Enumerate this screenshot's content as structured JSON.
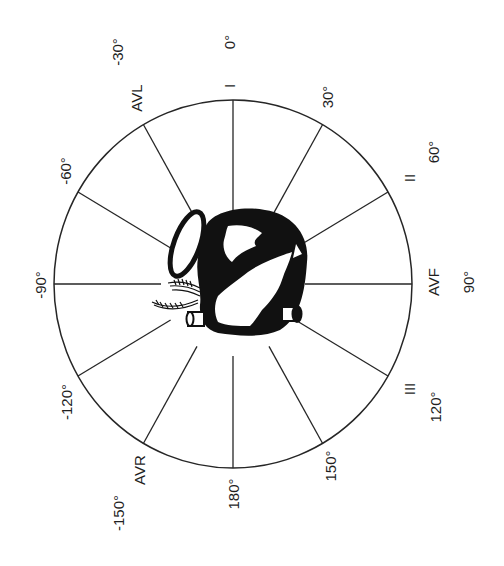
{
  "diagram": {
    "center": {
      "x": 233,
      "y": 284
    },
    "radius": {
      "rx": 179,
      "ry": 184
    },
    "spoke_inner_radius": 72,
    "colors": {
      "line": "#262626",
      "text": "#1f1f1f",
      "heart": "#111111",
      "background": "#ffffff"
    },
    "orientation": "rotated 90° counter-clockwise; 0° at top, angles increase clockwise",
    "spokes_deg": [
      0,
      30,
      60,
      90,
      120,
      150,
      180,
      -150,
      -120,
      -90,
      -60,
      -30
    ],
    "degree_labels": [
      {
        "text": "0°",
        "x": 229,
        "y": 42
      },
      {
        "text": "30°",
        "x": 327,
        "y": 97
      },
      {
        "text": "60°",
        "x": 433,
        "y": 152
      },
      {
        "text": "90°",
        "x": 468,
        "y": 282
      },
      {
        "text": "120°",
        "x": 435,
        "y": 407
      },
      {
        "text": "150°",
        "x": 330,
        "y": 466
      },
      {
        "text": "180°",
        "x": 233,
        "y": 494
      },
      {
        "text": "-150°",
        "x": 118,
        "y": 513
      },
      {
        "text": "-120°",
        "x": 66,
        "y": 402
      },
      {
        "text": "-90°",
        "x": 40,
        "y": 285
      },
      {
        "text": "-60°",
        "x": 65,
        "y": 171
      },
      {
        "text": "-30°",
        "x": 117,
        "y": 52
      }
    ],
    "lead_labels": [
      {
        "text": "I",
        "x": 229,
        "y": 86
      },
      {
        "text": "II",
        "x": 409,
        "y": 178
      },
      {
        "text": "AVF",
        "x": 433,
        "y": 282
      },
      {
        "text": "III",
        "x": 409,
        "y": 389
      },
      {
        "text": "AVR",
        "x": 139,
        "y": 470
      },
      {
        "text": "AVL",
        "x": 136,
        "y": 98
      }
    ],
    "center_illustration": "heart-icon"
  }
}
